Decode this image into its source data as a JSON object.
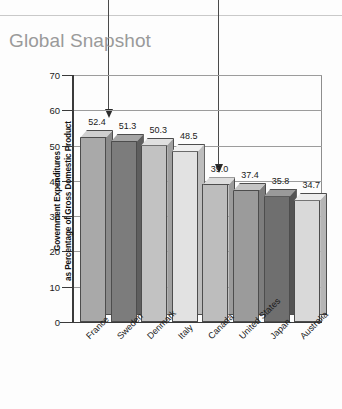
{
  "title": "Global Snapshot",
  "colors": {
    "title": "#9a9a9a",
    "axis": "#3a3a3a",
    "grid": "#9c9c9c",
    "arrow": "#2b2b2b",
    "background": "#fdfdfd"
  },
  "annotations": [
    {
      "name": "arrow-to-title",
      "target": "Global Snapshot"
    },
    {
      "name": "arrow-to-canada-bar",
      "target": "39.0"
    }
  ],
  "chart_data": {
    "type": "bar",
    "title": "Global Snapshot",
    "xlabel": "",
    "ylabel": "Government Expenditures as Percentage of Gross Domestic Product",
    "ylabel_line1": "Government Expenditures",
    "ylabel_line2": "as Percentage of Gross Domestic Product",
    "ylim": [
      0,
      70
    ],
    "yticks": [
      0,
      10,
      20,
      30,
      40,
      50,
      60,
      70
    ],
    "ytick_labels": [
      "0",
      "10",
      "20",
      "30",
      "40",
      "50",
      "60",
      "70"
    ],
    "grid": true,
    "legend": "none",
    "categories": [
      "France",
      "Sweden",
      "Denmark",
      "Italy",
      "Canada",
      "United States",
      "Japan",
      "Australia"
    ],
    "values": [
      52.4,
      51.3,
      50.3,
      48.5,
      39.0,
      37.4,
      35.8,
      34.7
    ],
    "value_labels": [
      "52.4",
      "51.3",
      "50.3",
      "48.5",
      "39.0",
      "37.4",
      "35.8",
      "34.7"
    ],
    "bar_colors": [
      "#a9a9a9",
      "#7c7c7c",
      "#c2c2c2",
      "#e2e2e2",
      "#bdbdbd",
      "#9b9b9b",
      "#6f6f6f",
      "#d9d9d9"
    ],
    "bar_side_colors": [
      "#8a8a8a",
      "#5e5e5e",
      "#a0a0a0",
      "#bdbdbd",
      "#9b9b9b",
      "#7d7d7d",
      "#545454",
      "#b5b5b5"
    ],
    "bar_top_colors": [
      "#cfcfcf",
      "#a5a5a5",
      "#e0e0e0",
      "#f0f0f0",
      "#dcdcdc",
      "#c4c4c4",
      "#9a9a9a",
      "#ededed"
    ]
  }
}
